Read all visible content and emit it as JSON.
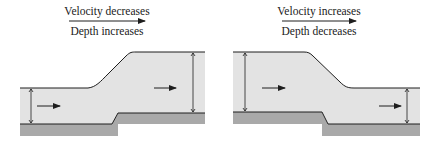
{
  "panels": [
    {
      "id": "left",
      "top_label": "Velocity decreases",
      "bottom_label": "Depth increases",
      "description": "Flow over a raised step: water depth increases, velocity decreases"
    },
    {
      "id": "right",
      "top_label": "Velocity increases",
      "bottom_label": "Depth decreases",
      "description": "Flow over a lowered step: water depth decreases, velocity increases"
    }
  ],
  "colors": {
    "water": "#e3e3e3",
    "ground": "#a9a9a9",
    "line": "#1e1e1e",
    "background": "#ffffff"
  }
}
